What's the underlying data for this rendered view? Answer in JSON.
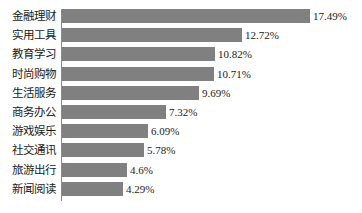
{
  "chart_data": {
    "type": "bar",
    "orientation": "horizontal",
    "title": "",
    "subtitle": "",
    "xlabel": "",
    "ylabel": "",
    "grid": false,
    "legend": false,
    "value_suffix": "%",
    "xlim": [
      0,
      17.49
    ],
    "categories": [
      "金融理财",
      "实用工具",
      "教育学习",
      "时尚购物",
      "生活服务",
      "商务办公",
      "游戏娱乐",
      "社交通讯",
      "旅游出行",
      "新闻阅读"
    ],
    "values": [
      17.49,
      12.72,
      10.82,
      10.71,
      9.69,
      7.32,
      6.09,
      5.78,
      4.6,
      4.29
    ],
    "value_labels": [
      "17.49%",
      "12.72%",
      "10.82%",
      "10.71%",
      "9.69%",
      "7.32%",
      "6.09%",
      "5.78%",
      "4.6%",
      "4.29%"
    ],
    "bar_color": "#808080",
    "axis_color": "#8a8a8a",
    "text_color": "#1a1a1a",
    "background_color": "#ffffff"
  }
}
